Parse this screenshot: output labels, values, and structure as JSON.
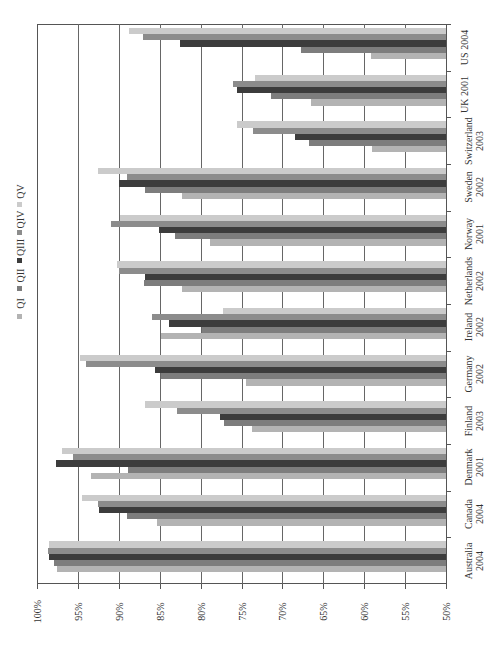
{
  "chart_data": {
    "type": "bar",
    "orientation": "horizontal (page rotated 90° counter-clockwise)",
    "title": "",
    "xlabel": "",
    "ylabel": "",
    "ylim": [
      50,
      100
    ],
    "value_ticks": [
      "50%",
      "55%",
      "60%",
      "65%",
      "70%",
      "75%",
      "80%",
      "85%",
      "90%",
      "95%",
      "100%"
    ],
    "grid": true,
    "legend_position": "top (left side in rotated view)",
    "categories": [
      "Australia 2004",
      "Canada 2004",
      "Denmark 2001",
      "Finland 2003",
      "Germany 2002",
      "Ireland 2002",
      "Netherlands 2002",
      "Norway 2001",
      "Sweden 2002",
      "Switzerland 2003",
      "UK 2001",
      "US 2004"
    ],
    "category_lines": [
      [
        "Australia",
        "2004"
      ],
      [
        "Canada",
        "2004"
      ],
      [
        "Denmark",
        "2001"
      ],
      [
        "Finland",
        "2003"
      ],
      [
        "Germany",
        "2002"
      ],
      [
        "Ireland",
        "2002"
      ],
      [
        "Netherlands",
        "2002"
      ],
      [
        "Norway",
        "2001"
      ],
      [
        "Sweden",
        "2002"
      ],
      [
        "Switzerland",
        "2003"
      ],
      [
        "UK 2001",
        ""
      ],
      [
        "US 2004",
        ""
      ]
    ],
    "series": [
      {
        "name": "QI",
        "color": "#b3b3b3",
        "values": [
          97.5,
          85.3,
          93.4,
          73.7,
          74.4,
          84.8,
          82.3,
          78.8,
          82.3,
          59.1,
          66.5,
          59.2
        ]
      },
      {
        "name": "QII",
        "color": "#7d7d7d",
        "values": [
          97.9,
          89.0,
          88.9,
          77.2,
          84.8,
          79.8,
          86.9,
          83.1,
          86.8,
          66.7,
          71.4,
          67.7
        ]
      },
      {
        "name": "QIII",
        "color": "#3c3c3c",
        "values": [
          98.5,
          92.4,
          97.7,
          77.6,
          85.6,
          83.9,
          86.8,
          85.1,
          90.0,
          68.5,
          75.6,
          82.5
        ]
      },
      {
        "name": "QIV",
        "color": "#8c8c8c",
        "values": [
          98.6,
          92.6,
          95.6,
          82.9,
          94.0,
          86.0,
          90.0,
          91.0,
          89.0,
          73.6,
          76.0,
          87.1
        ]
      },
      {
        "name": "QV",
        "color": "#cbcbcb",
        "values": [
          98.5,
          94.5,
          97.0,
          86.8,
          94.7,
          77.3,
          90.2,
          89.9,
          92.6,
          75.6,
          73.4,
          88.8
        ]
      }
    ]
  },
  "legend": [
    {
      "label": "QI",
      "color": "#b3b3b3"
    },
    {
      "label": "QII",
      "color": "#7d7d7d"
    },
    {
      "label": "QIII",
      "color": "#3c3c3c"
    },
    {
      "label": "QIV",
      "color": "#8c8c8c"
    },
    {
      "label": "QV",
      "color": "#cbcbcb"
    }
  ]
}
